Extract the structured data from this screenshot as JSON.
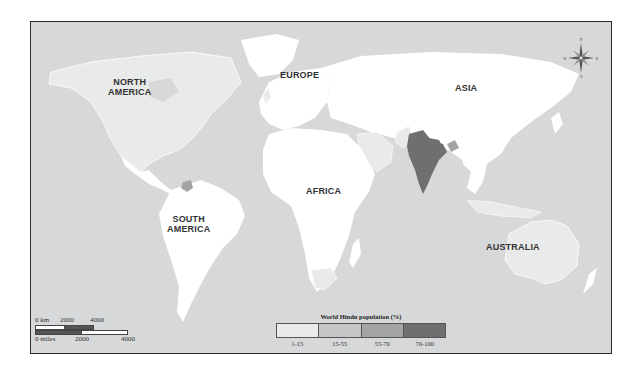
{
  "map": {
    "title": "World Hindu population (%)",
    "colors": {
      "ocean": "#d6d8d9",
      "land_none": "#ffffff",
      "class_1_15": "#e9eaea",
      "class_15_55": "#c4c5c6",
      "class_55_70": "#a3a4a5",
      "class_70_100": "#6e6f70",
      "frame": "#2a2a2a"
    },
    "continent_labels": [
      {
        "name": "NORTH\nAMERICA",
        "line1": "NORTH",
        "line2": "AMERICA"
      },
      {
        "name": "EUROPE",
        "line1": "EUROPE"
      },
      {
        "name": "ASIA",
        "line1": "ASIA"
      },
      {
        "name": "AFRICA",
        "line1": "AFRICA"
      },
      {
        "name": "SOUTH\nAMERICA",
        "line1": "SOUTH",
        "line2": "AMERICA"
      },
      {
        "name": "AUSTRALIA",
        "line1": "AUSTRALIA"
      }
    ],
    "legend": {
      "title": "World Hindu population (%)",
      "classes": [
        {
          "label": "1-15",
          "color": "#e9eaea"
        },
        {
          "label": "15-55",
          "color": "#c4c5c6"
        },
        {
          "label": "55-70",
          "color": "#a3a4a5"
        },
        {
          "label": "70-100",
          "color": "#6e6f70"
        }
      ]
    },
    "scale_bar": {
      "km": {
        "unit_label": "0 km",
        "ticks": [
          "2000",
          "4000"
        ]
      },
      "miles": {
        "unit_label": "0 miles",
        "ticks": [
          "2000",
          "4000"
        ]
      }
    },
    "compass": {
      "n": "N",
      "s": "S",
      "e": "E",
      "w": "W"
    },
    "shaded_regions": {
      "70-100": [
        "India",
        "Nepal"
      ],
      "15-55": [
        "Guyana",
        "Suriname",
        "Mauritius",
        "Bhutan"
      ],
      "1-15": [
        "United States",
        "Canada",
        "United Kingdom",
        "South Africa",
        "Arabian Peninsula",
        "Pakistan",
        "Bangladesh",
        "Sri Lanka",
        "Malaysia",
        "Indonesia",
        "Australia",
        "Fiji",
        "Trinidad"
      ]
    }
  }
}
